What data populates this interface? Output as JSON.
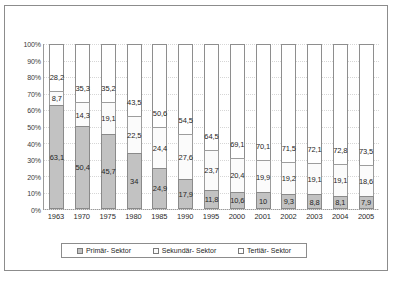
{
  "top_strip": {
    "text": ""
  },
  "chart_data": {
    "type": "bar",
    "stacked": true,
    "stack_mode": "percent",
    "title": "",
    "subtitle": "",
    "xlabel": "",
    "ylabel": "",
    "ylim": [
      0,
      100
    ],
    "grid": true,
    "legend_position": "bottom",
    "categories": [
      "1963",
      "1970",
      "1975",
      "1980",
      "1985",
      "1990",
      "1995",
      "2000",
      "2001",
      "2002",
      "2003",
      "2004",
      "2005"
    ],
    "ytick_labels": [
      "100%",
      "90%",
      "80%",
      "70%",
      "60%",
      "50%",
      "40%",
      "30%",
      "20%",
      "10%",
      "0%"
    ],
    "ytick_values": [
      100,
      90,
      80,
      70,
      60,
      50,
      40,
      30,
      20,
      10,
      0
    ],
    "series": [
      {
        "name": "Primär- Sektor",
        "color": "#c2c2c2",
        "values": [
          63.1,
          50.4,
          45.7,
          34,
          24.9,
          17.9,
          11.8,
          10.6,
          10,
          9.3,
          8.8,
          8.1,
          7.9
        ],
        "labels": [
          "63,1",
          "50,4",
          "45,7",
          "34",
          "24,9",
          "17,9",
          "11,8",
          "10,6",
          "10",
          "9,3",
          "8,8",
          "8,1",
          "7,9"
        ]
      },
      {
        "name": "Sekundär- Sektor",
        "color": "#fbfbfb",
        "values": [
          8.7,
          14.3,
          19.1,
          22.5,
          24.4,
          27.6,
          23.7,
          20.4,
          19.9,
          19.2,
          19.1,
          19.1,
          18.6
        ],
        "labels": [
          "8,7",
          "14,3",
          "19,1",
          "22,5",
          "24,4",
          "27,6",
          "23,7",
          "20,4",
          "19,9",
          "19,2",
          "19,1",
          "19,1",
          "18,6"
        ]
      },
      {
        "name": "Tertiär- Sektor",
        "color": "#ffffff",
        "values": [
          28.2,
          35.3,
          35.2,
          43.5,
          50.6,
          54.5,
          64.5,
          69.1,
          70.1,
          71.5,
          72.1,
          72.8,
          73.5
        ],
        "labels": [
          "28,2",
          "35,3",
          "35,2",
          "43,5",
          "50,6",
          "54,5",
          "64,5",
          "69,1",
          "70,1",
          "71,5",
          "72,1",
          "72,8",
          "73,5"
        ]
      }
    ]
  }
}
